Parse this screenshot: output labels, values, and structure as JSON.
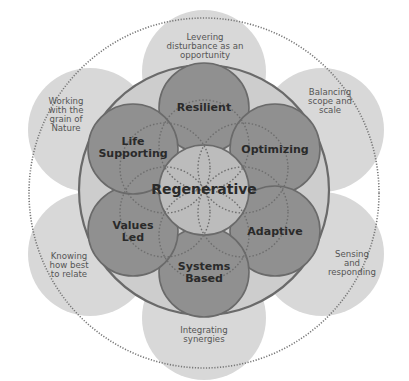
{
  "diagram": {
    "center": {
      "label": "Regenerative"
    },
    "principles": [
      {
        "label": "Resilient"
      },
      {
        "label": "Optimizing"
      },
      {
        "label": "Adaptive"
      },
      {
        "label": "Systems Based"
      },
      {
        "label": "Values Led"
      },
      {
        "label": "Life Supporting"
      }
    ],
    "outer_petals": [
      {
        "label": "Levering disturbance as an opportunity"
      },
      {
        "label": "Balancing scope and scale"
      },
      {
        "label": "Sensing and responding"
      },
      {
        "label": "Integrating synergies"
      },
      {
        "label": "Knowing how best to relate"
      },
      {
        "label": "Working with the grain of Nature"
      }
    ],
    "colors": {
      "petal": "#d6d6d6",
      "ring_fill": "#cbcbcb",
      "ring_stroke": "#6e6e6e",
      "principle": "#8f8f8f",
      "center": "#bdbdbd",
      "text": "#2a2a2a"
    }
  }
}
